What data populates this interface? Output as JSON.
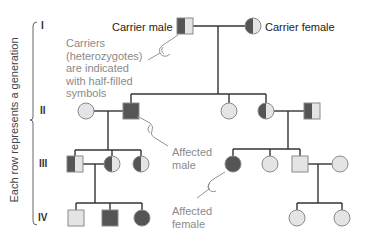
{
  "axis_label": "Each row represents a generation",
  "generations": [
    "I",
    "II",
    "III",
    "IV"
  ],
  "labels": {
    "carrier_male": "Carrier male",
    "carrier_female": "Carrier female",
    "carriers_note": [
      "Carriers",
      "(heterozygotes)",
      "are indicated",
      "with half-filled",
      "symbols"
    ],
    "affected_male": [
      "Affected",
      "male"
    ],
    "affected_female": [
      "Affected",
      "female"
    ]
  },
  "colors": {
    "affected": "#555555",
    "unaffected": "#e4e4e4",
    "outline": "#8a8a8a",
    "line": "#333333"
  },
  "individuals": [
    {
      "gen": "I",
      "sex": "male",
      "status": "carrier",
      "x": 185,
      "y": 26
    },
    {
      "gen": "I",
      "sex": "female",
      "status": "carrier",
      "x": 253,
      "y": 26
    },
    {
      "gen": "II",
      "sex": "female",
      "status": "unaffected",
      "x": 86,
      "y": 111
    },
    {
      "gen": "II",
      "sex": "male",
      "status": "affected",
      "x": 131,
      "y": 111
    },
    {
      "gen": "II",
      "sex": "female",
      "status": "unaffected",
      "x": 229,
      "y": 111
    },
    {
      "gen": "II",
      "sex": "female",
      "status": "carrier",
      "x": 266,
      "y": 111
    },
    {
      "gen": "II",
      "sex": "male",
      "status": "carrier",
      "x": 312,
      "y": 111
    },
    {
      "gen": "III",
      "sex": "male",
      "status": "carrier",
      "x": 75,
      "y": 164
    },
    {
      "gen": "III",
      "sex": "female",
      "status": "carrier",
      "x": 112,
      "y": 164
    },
    {
      "gen": "III",
      "sex": "female",
      "status": "carrier",
      "x": 141,
      "y": 164
    },
    {
      "gen": "III",
      "sex": "female",
      "status": "affected",
      "x": 233,
      "y": 164
    },
    {
      "gen": "III",
      "sex": "female",
      "status": "unaffected",
      "x": 270,
      "y": 164
    },
    {
      "gen": "III",
      "sex": "male",
      "status": "unaffected",
      "x": 300,
      "y": 164
    },
    {
      "gen": "III",
      "sex": "female",
      "status": "unaffected",
      "x": 340,
      "y": 164
    },
    {
      "gen": "IV",
      "sex": "male",
      "status": "unaffected",
      "x": 76,
      "y": 218
    },
    {
      "gen": "IV",
      "sex": "male",
      "status": "affected",
      "x": 110,
      "y": 218
    },
    {
      "gen": "IV",
      "sex": "female",
      "status": "affected",
      "x": 142,
      "y": 218
    },
    {
      "gen": "IV",
      "sex": "female",
      "status": "unaffected",
      "x": 297,
      "y": 218
    },
    {
      "gen": "IV",
      "sex": "female",
      "status": "unaffected",
      "x": 342,
      "y": 218
    }
  ]
}
